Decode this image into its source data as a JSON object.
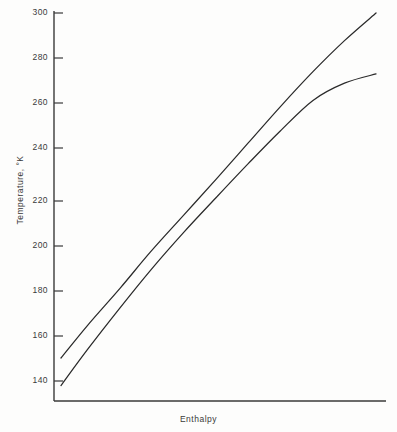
{
  "chart_data": {
    "type": "line",
    "title": "",
    "xlabel": "Enthalpy",
    "ylabel": "Temperature, °K",
    "ylim": [
      132,
      300
    ],
    "xlim": [
      0,
      1
    ],
    "grid": false,
    "legend": "none",
    "ytick_labels": [
      "300",
      "280",
      "260",
      "240",
      "220",
      "200",
      "180",
      "160",
      "140"
    ],
    "ytick_values": [
      300,
      280,
      260,
      240,
      220,
      200,
      180,
      160,
      140
    ],
    "xtick_labels": [],
    "series": [
      {
        "name": "upper-curve",
        "x": [
          0.021,
          0.1,
          0.2,
          0.29,
          0.39,
          0.49,
          0.585,
          0.68,
          0.78,
          0.875,
          0.97
        ],
        "values": [
          150.0,
          164.0,
          180.5,
          196.0,
          212.0,
          228.0,
          243.5,
          259.0,
          274.5,
          288.0,
          300.0
        ]
      },
      {
        "name": "lower-curve",
        "x": [
          0.021,
          0.1,
          0.2,
          0.29,
          0.39,
          0.49,
          0.585,
          0.68,
          0.78,
          0.875,
          0.97
        ],
        "values": [
          138.0,
          153.5,
          172.0,
          188.0,
          204.5,
          220.0,
          234.5,
          248.5,
          262.0,
          269.5,
          273.5
        ]
      }
    ]
  },
  "axes": {
    "yaxis_name": "temperature-axis",
    "xaxis_name": "enthalpy-axis"
  },
  "colors": {
    "line": "#2a2a2a",
    "axis": "#3a3a3a",
    "background": "#fdfdfc"
  }
}
